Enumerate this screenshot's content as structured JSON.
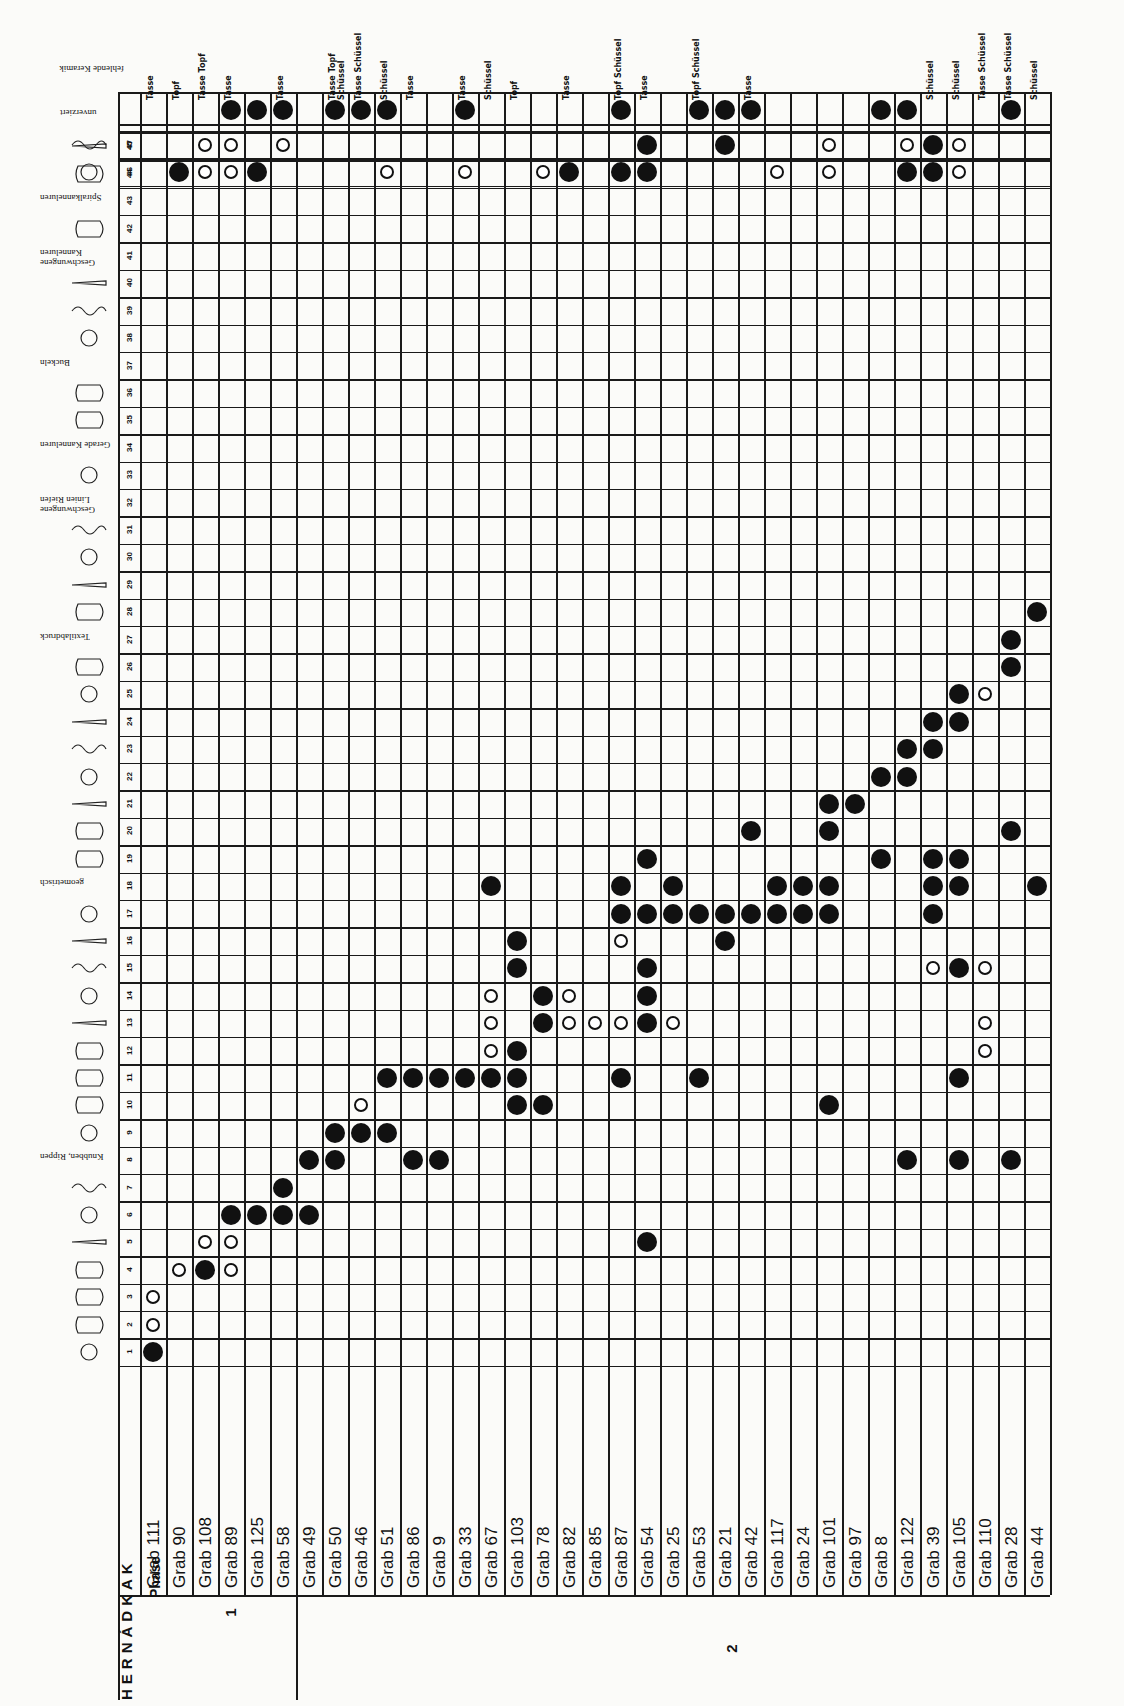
{
  "title": "HERNÁDKAK",
  "phase_header": "Phase",
  "phases": [
    {
      "label": "1",
      "graves_from": 0,
      "graves_to": 5
    },
    {
      "label": "2",
      "graves_from": 6,
      "graves_to": 35
    }
  ],
  "graves": [
    "Grab 111",
    "Grab 90",
    "Grab 108",
    "Grab 89",
    "Grab 125",
    "Grab 58",
    "Grab 49",
    "Grab 50",
    "Grab 46",
    "Grab 51",
    "Grab 86",
    "Grab 9",
    "Grab 33",
    "Grab 67",
    "Grab 103",
    "Grab 78",
    "Grab 82",
    "Grab 85",
    "Grab 87",
    "Grab 54",
    "Grab 25",
    "Grab 53",
    "Grab 21",
    "Grab 42",
    "Grab 117",
    "Grab 24",
    "Grab 101",
    "Grab 97",
    "Grab 8",
    "Grab 122",
    "Grab 39",
    "Grab 105",
    "Grab 110",
    "Grab 28",
    "Grab 44"
  ],
  "type_numbers": [
    "1",
    "2",
    "3",
    "4",
    "5",
    "6",
    "7",
    "8",
    "9",
    "10",
    "11",
    "12",
    "13",
    "14",
    "15",
    "16",
    "17",
    "18",
    "19",
    "20",
    "21",
    "22",
    "23",
    "24",
    "25",
    "26",
    "27",
    "28",
    "29",
    "30",
    "31",
    "32",
    "33",
    "34",
    "35",
    "36",
    "37",
    "38",
    "39",
    "40",
    "41",
    "42",
    "43",
    "44",
    "45",
    "46",
    "47"
  ],
  "type_annotations": [
    {
      "type": 8,
      "text": "Knubben, Rippen"
    },
    {
      "type": 18,
      "text": "geometrisch"
    },
    {
      "type": 27,
      "text": "Textilabdruck"
    },
    {
      "type": 32,
      "text": "Geschwungene Linien Riefen"
    },
    {
      "type": 34,
      "text": "Gerade Kanneluren"
    },
    {
      "type": 37,
      "text": "Buckeln"
    },
    {
      "type": 41,
      "text": "Geschwungene Kanneluren"
    },
    {
      "type": 43,
      "text": "Spiralkanneluren"
    }
  ],
  "extra_rows": {
    "unverziert": "unverziert",
    "fehlende_keramik": "fehlende Keramik"
  },
  "legend": {
    "filled": "●",
    "open": "○"
  },
  "keramik_labels": [
    "Tasse",
    "Topf",
    "Tasse Topf",
    "Tasse",
    "",
    "Tasse",
    "",
    "Tasse Topf Schüssel",
    "Tasse Schüssel",
    "Schüssel",
    "Tasse",
    "",
    "Tasse",
    "Schüssel",
    "Topf",
    "",
    "Tasse",
    "",
    "Topf Schüssel",
    "Tasse",
    "",
    "Topf Schüssel",
    "",
    "Tasse",
    "",
    "",
    "",
    "",
    "",
    "",
    "Schüssel",
    "Schüssel",
    "Tasse Schüssel",
    "Tasse Schüssel",
    "Schüssel"
  ],
  "unverziert_row": [
    0,
    0,
    0,
    1,
    1,
    1,
    0,
    1,
    1,
    1,
    0,
    0,
    1,
    0,
    0,
    0,
    0,
    0,
    1,
    0,
    0,
    1,
    1,
    1,
    0,
    0,
    0,
    0,
    1,
    1,
    0,
    0,
    0,
    1,
    0
  ],
  "cells": [
    {
      "t": 1,
      "g": 0,
      "v": "full"
    },
    {
      "t": 2,
      "g": 0,
      "v": "open"
    },
    {
      "t": 3,
      "g": 0,
      "v": "open"
    },
    {
      "t": 4,
      "g": 1,
      "v": "open"
    },
    {
      "t": 4,
      "g": 2,
      "v": "full"
    },
    {
      "t": 4,
      "g": 3,
      "v": "open"
    },
    {
      "t": 5,
      "g": 2,
      "v": "open"
    },
    {
      "t": 5,
      "g": 3,
      "v": "open"
    },
    {
      "t": 5,
      "g": 19,
      "v": "full"
    },
    {
      "t": 6,
      "g": 3,
      "v": "full"
    },
    {
      "t": 6,
      "g": 4,
      "v": "full"
    },
    {
      "t": 6,
      "g": 5,
      "v": "full"
    },
    {
      "t": 6,
      "g": 6,
      "v": "full"
    },
    {
      "t": 7,
      "g": 5,
      "v": "full"
    },
    {
      "t": 8,
      "g": 6,
      "v": "full"
    },
    {
      "t": 8,
      "g": 7,
      "v": "full"
    },
    {
      "t": 8,
      "g": 10,
      "v": "full"
    },
    {
      "t": 8,
      "g": 11,
      "v": "full"
    },
    {
      "t": 8,
      "g": 29,
      "v": "full"
    },
    {
      "t": 8,
      "g": 31,
      "v": "full"
    },
    {
      "t": 8,
      "g": 33,
      "v": "full"
    },
    {
      "t": 9,
      "g": 7,
      "v": "full"
    },
    {
      "t": 9,
      "g": 8,
      "v": "full"
    },
    {
      "t": 9,
      "g": 9,
      "v": "full"
    },
    {
      "t": 10,
      "g": 8,
      "v": "open"
    },
    {
      "t": 10,
      "g": 14,
      "v": "full"
    },
    {
      "t": 10,
      "g": 15,
      "v": "full"
    },
    {
      "t": 10,
      "g": 26,
      "v": "full"
    },
    {
      "t": 11,
      "g": 9,
      "v": "full"
    },
    {
      "t": 11,
      "g": 10,
      "v": "full"
    },
    {
      "t": 11,
      "g": 11,
      "v": "full"
    },
    {
      "t": 11,
      "g": 12,
      "v": "full"
    },
    {
      "t": 11,
      "g": 13,
      "v": "full"
    },
    {
      "t": 11,
      "g": 14,
      "v": "full"
    },
    {
      "t": 11,
      "g": 18,
      "v": "full"
    },
    {
      "t": 11,
      "g": 21,
      "v": "full"
    },
    {
      "t": 11,
      "g": 31,
      "v": "full"
    },
    {
      "t": 12,
      "g": 13,
      "v": "open"
    },
    {
      "t": 12,
      "g": 14,
      "v": "full"
    },
    {
      "t": 12,
      "g": 32,
      "v": "open"
    },
    {
      "t": 13,
      "g": 13,
      "v": "open"
    },
    {
      "t": 13,
      "g": 15,
      "v": "full"
    },
    {
      "t": 13,
      "g": 16,
      "v": "open"
    },
    {
      "t": 13,
      "g": 17,
      "v": "open"
    },
    {
      "t": 13,
      "g": 18,
      "v": "open"
    },
    {
      "t": 13,
      "g": 19,
      "v": "full"
    },
    {
      "t": 13,
      "g": 20,
      "v": "open"
    },
    {
      "t": 13,
      "g": 32,
      "v": "open"
    },
    {
      "t": 14,
      "g": 13,
      "v": "open"
    },
    {
      "t": 14,
      "g": 15,
      "v": "full"
    },
    {
      "t": 14,
      "g": 16,
      "v": "open"
    },
    {
      "t": 14,
      "g": 19,
      "v": "full"
    },
    {
      "t": 15,
      "g": 14,
      "v": "full"
    },
    {
      "t": 15,
      "g": 19,
      "v": "full"
    },
    {
      "t": 15,
      "g": 30,
      "v": "open"
    },
    {
      "t": 15,
      "g": 31,
      "v": "full"
    },
    {
      "t": 15,
      "g": 32,
      "v": "open"
    },
    {
      "t": 16,
      "g": 14,
      "v": "full"
    },
    {
      "t": 16,
      "g": 18,
      "v": "open"
    },
    {
      "t": 16,
      "g": 22,
      "v": "full"
    },
    {
      "t": 17,
      "g": 18,
      "v": "full"
    },
    {
      "t": 17,
      "g": 19,
      "v": "full"
    },
    {
      "t": 17,
      "g": 20,
      "v": "full"
    },
    {
      "t": 17,
      "g": 21,
      "v": "full"
    },
    {
      "t": 17,
      "g": 22,
      "v": "full"
    },
    {
      "t": 17,
      "g": 23,
      "v": "full"
    },
    {
      "t": 17,
      "g": 24,
      "v": "full"
    },
    {
      "t": 17,
      "g": 25,
      "v": "full"
    },
    {
      "t": 17,
      "g": 26,
      "v": "full"
    },
    {
      "t": 17,
      "g": 30,
      "v": "full"
    },
    {
      "t": 18,
      "g": 13,
      "v": "full"
    },
    {
      "t": 18,
      "g": 18,
      "v": "full"
    },
    {
      "t": 18,
      "g": 20,
      "v": "full"
    },
    {
      "t": 18,
      "g": 24,
      "v": "full"
    },
    {
      "t": 18,
      "g": 25,
      "v": "full"
    },
    {
      "t": 18,
      "g": 26,
      "v": "full"
    },
    {
      "t": 18,
      "g": 30,
      "v": "full"
    },
    {
      "t": 18,
      "g": 31,
      "v": "full"
    },
    {
      "t": 18,
      "g": 34,
      "v": "full"
    },
    {
      "t": 19,
      "g": 19,
      "v": "full"
    },
    {
      "t": 19,
      "g": 28,
      "v": "full"
    },
    {
      "t": 19,
      "g": 30,
      "v": "full"
    },
    {
      "t": 19,
      "g": 31,
      "v": "full"
    },
    {
      "t": 20,
      "g": 23,
      "v": "full"
    },
    {
      "t": 20,
      "g": 26,
      "v": "full"
    },
    {
      "t": 20,
      "g": 33,
      "v": "full"
    },
    {
      "t": 21,
      "g": 26,
      "v": "full"
    },
    {
      "t": 21,
      "g": 27,
      "v": "full"
    },
    {
      "t": 22,
      "g": 28,
      "v": "full"
    },
    {
      "t": 22,
      "g": 29,
      "v": "full"
    },
    {
      "t": 23,
      "g": 29,
      "v": "full"
    },
    {
      "t": 23,
      "g": 30,
      "v": "full"
    },
    {
      "t": 24,
      "g": 30,
      "v": "full"
    },
    {
      "t": 24,
      "g": 31,
      "v": "full"
    },
    {
      "t": 25,
      "g": 31,
      "v": "full"
    },
    {
      "t": 25,
      "g": 32,
      "v": "open"
    },
    {
      "t": 26,
      "g": 33,
      "v": "full"
    },
    {
      "t": 27,
      "g": 33,
      "v": "full"
    },
    {
      "t": 28,
      "g": 34,
      "v": "full"
    },
    {
      "t": 46,
      "g": 1,
      "v": "full"
    },
    {
      "t": 46,
      "g": 2,
      "v": "open"
    },
    {
      "t": 46,
      "g": 3,
      "v": "open"
    },
    {
      "t": 46,
      "g": 4,
      "v": "full"
    },
    {
      "t": 46,
      "g": 9,
      "v": "open"
    },
    {
      "t": 46,
      "g": 12,
      "v": "open"
    },
    {
      "t": 46,
      "g": 15,
      "v": "open"
    },
    {
      "t": 46,
      "g": 16,
      "v": "full"
    },
    {
      "t": 46,
      "g": 18,
      "v": "full"
    },
    {
      "t": 46,
      "g": 19,
      "v": "full"
    },
    {
      "t": 46,
      "g": 24,
      "v": "open"
    },
    {
      "t": 46,
      "g": 26,
      "v": "open"
    },
    {
      "t": 46,
      "g": 29,
      "v": "full"
    },
    {
      "t": 46,
      "g": 30,
      "v": "full"
    },
    {
      "t": 46,
      "g": 31,
      "v": "open"
    },
    {
      "t": 47,
      "g": 2,
      "v": "open"
    },
    {
      "t": 47,
      "g": 3,
      "v": "open"
    },
    {
      "t": 47,
      "g": 5,
      "v": "open"
    },
    {
      "t": 47,
      "g": 19,
      "v": "full"
    },
    {
      "t": 47,
      "g": 22,
      "v": "full"
    },
    {
      "t": 47,
      "g": 26,
      "v": "open"
    },
    {
      "t": 47,
      "g": 29,
      "v": "open"
    },
    {
      "t": 47,
      "g": 30,
      "v": "full"
    },
    {
      "t": 47,
      "g": 31,
      "v": "open"
    }
  ]
}
